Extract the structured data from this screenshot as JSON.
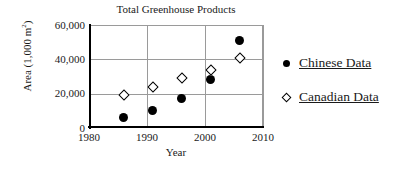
{
  "chart_data": {
    "type": "scatter",
    "title": "Total Greenhouse Products",
    "xlabel": "Year",
    "ylabel": "Area (1,000 m",
    "ylabel_sup": "2",
    "ylabel_close": ")",
    "xlim": [
      1980,
      2010
    ],
    "ylim": [
      0,
      60000
    ],
    "grid": true,
    "legend_position": "right",
    "xticks": [
      {
        "value": 1980,
        "label": "1980"
      },
      {
        "value": 1990,
        "label": "1990"
      },
      {
        "value": 2000,
        "label": "2000"
      },
      {
        "value": 2010,
        "label": "2010"
      }
    ],
    "yticks": [
      {
        "value": 60000,
        "label": "60,000"
      },
      {
        "value": 40000,
        "label": "40,000"
      },
      {
        "value": 20000,
        "label": "20,000"
      },
      {
        "value": 0,
        "label": "0"
      }
    ],
    "series": [
      {
        "name": "Chinese Data",
        "marker": "filled-circle",
        "color": "#000000",
        "points": [
          {
            "x": 1986,
            "y": 6000
          },
          {
            "x": 1991,
            "y": 10000
          },
          {
            "x": 1996,
            "y": 17000
          },
          {
            "x": 2001,
            "y": 28000
          },
          {
            "x": 2006,
            "y": 51000
          }
        ]
      },
      {
        "name": "Canadian Data",
        "marker": "open-diamond",
        "color": "#000000",
        "points": [
          {
            "x": 1986,
            "y": 19500
          },
          {
            "x": 1991,
            "y": 24000
          },
          {
            "x": 1996,
            "y": 29000
          },
          {
            "x": 2001,
            "y": 34000
          },
          {
            "x": 2006,
            "y": 41000
          }
        ]
      }
    ]
  },
  "legend": {
    "items": [
      {
        "label": "Chinese Data",
        "marker": "filled-circle"
      },
      {
        "label": "Canadian Data",
        "marker": "open-diamond"
      }
    ]
  }
}
